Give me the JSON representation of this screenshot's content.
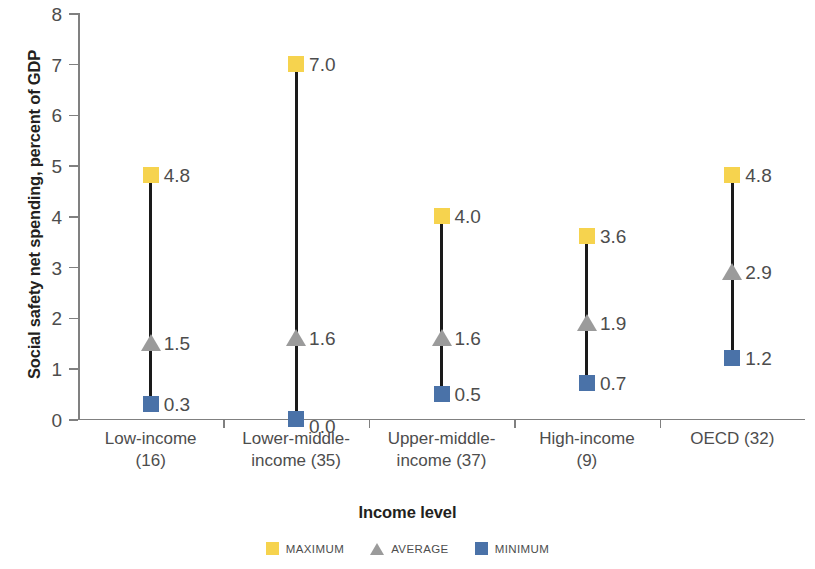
{
  "chart_data": {
    "type": "scatter",
    "title": "",
    "xlabel": "Income level",
    "ylabel": "Social safety net spending, percent of GDP",
    "ylim": [
      0,
      8
    ],
    "yticks": [
      "0",
      "1",
      "2",
      "3",
      "4",
      "5",
      "6",
      "7",
      "8"
    ],
    "grid": false,
    "legend_position": "bottom",
    "categories": [
      "Low-income (16)",
      "Lower-middle-income (35)",
      "Upper-middle-income (37)",
      "High-income (9)",
      "OECD (32)"
    ],
    "category_lines": [
      [
        "Low-income",
        "(16)"
      ],
      [
        "Lower-middle-",
        "income (35)"
      ],
      [
        "Upper-middle-",
        "income (37)"
      ],
      [
        "High-income",
        "(9)"
      ],
      [
        "OECD (32)",
        ""
      ]
    ],
    "series": [
      {
        "name": "MAXIMUM",
        "color": "#f6d34e",
        "marker": "square",
        "values": [
          4.8,
          7.0,
          4.0,
          3.6,
          4.8
        ],
        "labels": [
          "4.8",
          "7.0",
          "4.0",
          "3.6",
          "4.8"
        ]
      },
      {
        "name": "AVERAGE",
        "color": "#9b9b9b",
        "marker": "triangle",
        "values": [
          1.5,
          1.6,
          1.6,
          1.9,
          2.9
        ],
        "labels": [
          "1.5",
          "1.6",
          "1.6",
          "1.9",
          "2.9"
        ]
      },
      {
        "name": "MINIMUM",
        "color": "#4a72a8",
        "marker": "square",
        "values": [
          0.3,
          0.0,
          0.5,
          0.7,
          1.2
        ],
        "labels": [
          "0.3",
          "0.0",
          "0.5",
          "0.7",
          "1.2"
        ]
      }
    ]
  },
  "legend": {
    "items": [
      {
        "label": "MAXIMUM",
        "swatch": "max-square-swatch"
      },
      {
        "label": "AVERAGE",
        "swatch": "avg-triangle-swatch"
      },
      {
        "label": "MINIMUM",
        "swatch": "min-square-swatch"
      }
    ]
  },
  "axes": {
    "y_title": "Social safety net spending, percent of GDP",
    "x_title": "Income level",
    "y_ticks": [
      "8",
      "7",
      "6",
      "5",
      "4",
      "3",
      "2",
      "1",
      "0"
    ]
  }
}
